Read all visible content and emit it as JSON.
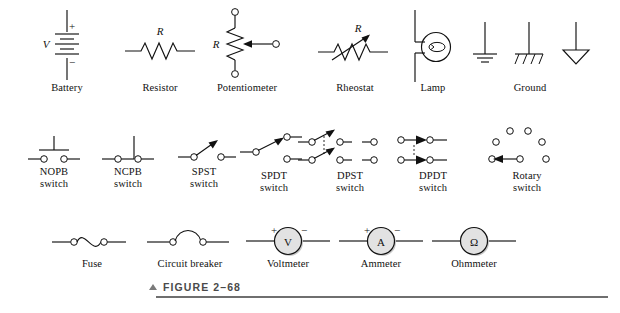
{
  "figure": {
    "caption_marker": "▲",
    "caption_label": "FIGURE 2–68"
  },
  "rows": [
    {
      "id": "row-1",
      "items": [
        {
          "key": "battery",
          "label": "Battery",
          "annotations": [
            "V",
            "+",
            "−"
          ]
        },
        {
          "key": "resistor",
          "label": "Resistor",
          "annotations": [
            "R"
          ]
        },
        {
          "key": "potentiometer",
          "label": "Potentiometer",
          "annotations": [
            "R"
          ]
        },
        {
          "key": "rheostat",
          "label": "Rheostat",
          "annotations": [
            "R"
          ]
        },
        {
          "key": "lamp",
          "label": "Lamp",
          "annotations": []
        },
        {
          "key": "ground",
          "label": "Ground",
          "annotations": []
        }
      ]
    },
    {
      "id": "row-2",
      "items": [
        {
          "key": "nopb-switch",
          "label": "NOPB\nswitch",
          "annotations": []
        },
        {
          "key": "ncpb-switch",
          "label": "NCPB\nswitch",
          "annotations": []
        },
        {
          "key": "spst-switch",
          "label": "SPST\nswitch",
          "annotations": []
        },
        {
          "key": "spdt-switch",
          "label": "SPDT\nswitch",
          "annotations": []
        },
        {
          "key": "dpst-switch",
          "label": "DPST\nswitch",
          "annotations": []
        },
        {
          "key": "dpdt-switch",
          "label": "DPDT\nswitch",
          "annotations": []
        },
        {
          "key": "rotary-switch",
          "label": "Rotary\nswitch",
          "annotations": []
        }
      ]
    },
    {
      "id": "row-3",
      "items": [
        {
          "key": "fuse",
          "label": "Fuse",
          "annotations": []
        },
        {
          "key": "circuit-breaker",
          "label": "Circuit breaker",
          "annotations": []
        },
        {
          "key": "voltmeter",
          "label": "Voltmeter",
          "annotations": [
            "+",
            "−",
            "V"
          ]
        },
        {
          "key": "ammeter",
          "label": "Ammeter",
          "annotations": [
            "+",
            "−",
            "A"
          ]
        },
        {
          "key": "ohmmeter",
          "label": "Ohmmeter",
          "annotations": [
            "Ω"
          ]
        }
      ]
    }
  ],
  "colors": {
    "ink": "#111111",
    "paper": "#ffffff",
    "meter_fill": "#e2e2e2",
    "caption_rule": "#6f6f6f",
    "caption_text": "#4a4a4a"
  }
}
